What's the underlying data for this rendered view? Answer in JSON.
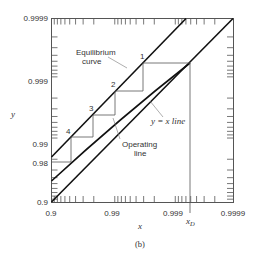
{
  "figure": {
    "caption": "(b)",
    "x_axis": {
      "label": "x",
      "ticks": [
        "0.9",
        "0.99",
        "0.999",
        "0.9999"
      ],
      "marker_label": "x",
      "marker_sub": "D"
    },
    "y_axis": {
      "label": "y",
      "ticks": [
        "0.9",
        "0.98",
        "0.99",
        "0.999",
        "0.9999"
      ]
    },
    "annotations": {
      "equilibrium_1": "Equilibrium",
      "equilibrium_2": "curve",
      "yx_line": "y = x line",
      "operating_1": "Operating",
      "operating_2": "line"
    },
    "stages": [
      "1",
      "2",
      "3",
      "4"
    ],
    "colors": {
      "line": "#111111",
      "thin": "#555555",
      "text": "#333333"
    }
  }
}
